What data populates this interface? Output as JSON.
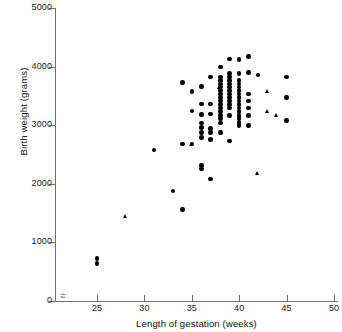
{
  "chart_data": {
    "type": "scatter",
    "title": "",
    "xlabel": "Length of gestation (weeks)",
    "ylabel": "Birth weight (grams)",
    "xlim": [
      24,
      50
    ],
    "ylim": [
      0,
      5000
    ],
    "xticks": [
      25,
      30,
      35,
      40,
      45,
      50
    ],
    "yticks": [
      0,
      1000,
      2000,
      3000,
      4000,
      5000
    ],
    "grid": false,
    "legend": "none",
    "axis_break_x": true,
    "series": [
      {
        "name": "circle",
        "marker": "circle",
        "color": "#000000",
        "points": [
          [
            25,
            730
          ],
          [
            25,
            640
          ],
          [
            31,
            2580
          ],
          [
            33,
            1880
          ],
          [
            34,
            1560
          ],
          [
            34,
            2680
          ],
          [
            34,
            3730
          ],
          [
            35,
            2680
          ],
          [
            35,
            3240
          ],
          [
            35,
            3580
          ],
          [
            36,
            2250
          ],
          [
            36,
            2310
          ],
          [
            36,
            2790
          ],
          [
            36,
            2880
          ],
          [
            36,
            2960
          ],
          [
            36,
            3040
          ],
          [
            36,
            3180
          ],
          [
            36,
            3360
          ],
          [
            36,
            3660
          ],
          [
            37,
            2080
          ],
          [
            37,
            2760
          ],
          [
            37,
            2880
          ],
          [
            37,
            2940
          ],
          [
            37,
            3190
          ],
          [
            37,
            3360
          ],
          [
            37,
            3820
          ],
          [
            38,
            2880
          ],
          [
            38,
            3040
          ],
          [
            38,
            3110
          ],
          [
            38,
            3170
          ],
          [
            38,
            3230
          ],
          [
            38,
            3290
          ],
          [
            38,
            3350
          ],
          [
            38,
            3410
          ],
          [
            38,
            3470
          ],
          [
            38,
            3530
          ],
          [
            38,
            3590
          ],
          [
            38,
            3650
          ],
          [
            38,
            3700
          ],
          [
            38,
            3760
          ],
          [
            38,
            3990
          ],
          [
            38,
            3820
          ],
          [
            39,
            2730
          ],
          [
            39,
            3170
          ],
          [
            39,
            3290
          ],
          [
            39,
            3350
          ],
          [
            39,
            3410
          ],
          [
            39,
            3470
          ],
          [
            39,
            3530
          ],
          [
            39,
            3590
          ],
          [
            39,
            3650
          ],
          [
            39,
            3700
          ],
          [
            39,
            3760
          ],
          [
            39,
            3820
          ],
          [
            39,
            3880
          ],
          [
            39,
            4130
          ],
          [
            40,
            2990
          ],
          [
            40,
            3050
          ],
          [
            40,
            3110
          ],
          [
            40,
            3170
          ],
          [
            40,
            3230
          ],
          [
            40,
            3290
          ],
          [
            40,
            3350
          ],
          [
            40,
            3410
          ],
          [
            40,
            3470
          ],
          [
            40,
            3530
          ],
          [
            40,
            3590
          ],
          [
            40,
            3650
          ],
          [
            40,
            3700
          ],
          [
            40,
            3760
          ],
          [
            40,
            3880
          ],
          [
            40,
            4120
          ],
          [
            41,
            2990
          ],
          [
            41,
            3170
          ],
          [
            41,
            3290
          ],
          [
            41,
            3410
          ],
          [
            41,
            3530
          ],
          [
            41,
            3900
          ],
          [
            41,
            4170
          ],
          [
            42,
            3860
          ],
          [
            45,
            3080
          ],
          [
            45,
            3470
          ],
          [
            45,
            3820
          ]
        ]
      },
      {
        "name": "triangle",
        "marker": "triangle",
        "color": "#000000",
        "points": [
          [
            28,
            1450
          ],
          [
            35,
            2680
          ],
          [
            38,
            3650
          ],
          [
            42,
            2180
          ],
          [
            43,
            3570
          ],
          [
            43,
            3240
          ],
          [
            44,
            3170
          ]
        ]
      }
    ]
  }
}
